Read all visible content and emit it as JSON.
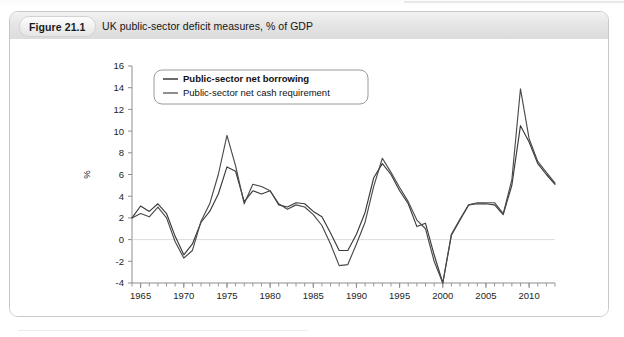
{
  "figure": {
    "badge_label": "Figure 21.1",
    "title": "UK public-sector deficit measures, % of GDP"
  },
  "chart_data": {
    "type": "line",
    "title": "UK public-sector deficit measures, % of GDP",
    "xlabel": "",
    "ylabel": "%",
    "xlim": [
      1964,
      2013
    ],
    "ylim": [
      -4,
      16
    ],
    "ytick_step": 2,
    "yticks": [
      -4,
      -2,
      0,
      2,
      4,
      6,
      8,
      10,
      12,
      14,
      16
    ],
    "ytick_labels": [
      "-4",
      "-2",
      "0",
      "2",
      "4",
      "6",
      "8",
      "10",
      "12",
      "14",
      "16"
    ],
    "xticks": [
      1965,
      1970,
      1975,
      1980,
      1985,
      1990,
      1995,
      2000,
      2005,
      2010
    ],
    "xtick_labels": [
      "1965",
      "1970",
      "1975",
      "1980",
      "1985",
      "1990",
      "1995",
      "2000",
      "2005",
      "2010"
    ],
    "x_minor_tick_interval": 1,
    "grid": false,
    "zero_line": true,
    "legend_position": "top-left",
    "x": [
      1964,
      1965,
      1966,
      1967,
      1968,
      1969,
      1970,
      1971,
      1972,
      1973,
      1974,
      1975,
      1976,
      1977,
      1978,
      1979,
      1980,
      1981,
      1982,
      1983,
      1984,
      1985,
      1986,
      1987,
      1988,
      1989,
      1990,
      1991,
      1992,
      1993,
      1994,
      1995,
      1996,
      1997,
      1998,
      1999,
      2000,
      2001,
      2002,
      2003,
      2004,
      2005,
      2006,
      2007,
      2008,
      2009,
      2010,
      2011,
      2012,
      2013
    ],
    "series": [
      {
        "name": "Public-sector net borrowing",
        "color": "#3a3a3a",
        "values": [
          2.0,
          3.1,
          2.6,
          3.3,
          2.4,
          0.3,
          -1.4,
          -0.4,
          1.6,
          2.6,
          4.2,
          6.7,
          6.3,
          3.5,
          4.5,
          4.2,
          4.5,
          3.2,
          3.0,
          3.4,
          3.3,
          2.6,
          2.1,
          0.6,
          -1.0,
          -1.0,
          0.5,
          2.5,
          5.7,
          7.0,
          6.0,
          4.5,
          3.3,
          1.2,
          1.5,
          -1.4,
          -4.0,
          0.4,
          1.8,
          3.2,
          3.3,
          3.3,
          3.2,
          2.3,
          5.0,
          10.5,
          9.0,
          7.0,
          6.0,
          5.1
        ]
      },
      {
        "name": "Public-sector net cash requirement",
        "color": "#4a4a4a",
        "values": [
          2.0,
          2.4,
          2.1,
          3.0,
          2.0,
          -0.2,
          -1.7,
          -1.0,
          1.7,
          3.3,
          6.0,
          9.6,
          6.8,
          3.3,
          5.1,
          4.9,
          4.5,
          3.3,
          2.8,
          3.2,
          3.0,
          2.3,
          1.3,
          -0.4,
          -2.4,
          -2.3,
          -0.4,
          1.6,
          4.9,
          7.5,
          6.2,
          4.8,
          3.5,
          1.8,
          1.0,
          -2.0,
          -4.0,
          0.5,
          1.9,
          3.2,
          3.4,
          3.4,
          3.4,
          2.4,
          5.5,
          13.9,
          9.3,
          7.2,
          6.2,
          5.2
        ]
      }
    ],
    "legend": [
      {
        "label": "Public-sector net borrowing",
        "color": "#3a3a3a",
        "emphasis": "bold"
      },
      {
        "label": "Public-sector net cash requirement",
        "color": "#6a6a6a",
        "emphasis": "normal"
      }
    ]
  }
}
